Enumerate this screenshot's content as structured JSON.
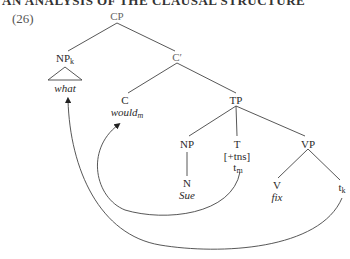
{
  "header": {
    "title": "AN ANALYSIS OF THE CLAUSAL STRUCTURE"
  },
  "example": {
    "number": "(26)"
  },
  "tree": {
    "nodes": {
      "cp": {
        "label": "CP"
      },
      "np_k": {
        "label": "NP",
        "sub": "k",
        "word": "what"
      },
      "c_bar": {
        "label": "C′"
      },
      "c": {
        "label": "C",
        "word": "would",
        "word_sub": "m"
      },
      "tp": {
        "label": "TP"
      },
      "np": {
        "label": "NP"
      },
      "n": {
        "label": "N",
        "word": "Sue"
      },
      "t": {
        "label": "T",
        "feature": "[+tns]",
        "trace": "t",
        "trace_sub": "m"
      },
      "vp": {
        "label": "VP"
      },
      "v": {
        "label": "V",
        "word": "fix"
      },
      "t_k": {
        "trace": "t",
        "trace_sub": "k"
      }
    },
    "movements": [
      {
        "from": "t_m",
        "to": "would_m",
        "type": "head-movement"
      },
      {
        "from": "t_k",
        "to": "what",
        "type": "wh-movement"
      }
    ]
  },
  "colors": {
    "line": "#444444",
    "text": "#2a2a2a"
  }
}
